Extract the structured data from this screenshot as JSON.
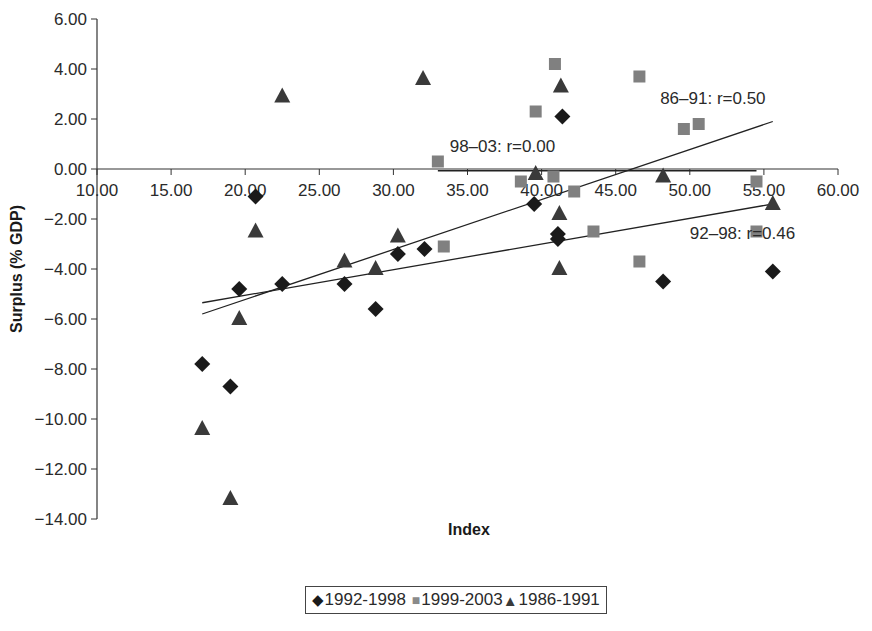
{
  "chart_data": {
    "type": "scatter",
    "title": "",
    "xlabel": "Index",
    "ylabel": "Surplus (% GDP)",
    "xlim": [
      10,
      60
    ],
    "ylim": [
      -14,
      6
    ],
    "x_ticks": [
      "10.00",
      "15.00",
      "20.00",
      "25.00",
      "30.00",
      "35.00",
      "40.00",
      "45.00",
      "50.00",
      "55.00",
      "60.00"
    ],
    "y_ticks": [
      "6.00",
      "4.00",
      "2.00",
      "0.00",
      "-2.00",
      "-4.00",
      "-6.00",
      "-8.00",
      "-10.00",
      "-12.00",
      "-14.00"
    ],
    "grid": false,
    "legend_position": "bottom",
    "series": [
      {
        "name": "1992-1998",
        "marker": "diamond",
        "color": "#1a1a1a",
        "points": [
          [
            17.1,
            -7.8
          ],
          [
            19.0,
            -8.7
          ],
          [
            19.6,
            -4.8
          ],
          [
            20.7,
            -1.1
          ],
          [
            22.5,
            -4.6
          ],
          [
            26.7,
            -4.6
          ],
          [
            28.8,
            -5.6
          ],
          [
            30.3,
            -3.4
          ],
          [
            32.1,
            -3.2
          ],
          [
            39.5,
            -1.4
          ],
          [
            41.1,
            -2.6
          ],
          [
            41.1,
            -2.8
          ],
          [
            41.4,
            2.1
          ],
          [
            48.2,
            -4.5
          ],
          [
            55.6,
            -4.1
          ]
        ]
      },
      {
        "name": "1999-2003",
        "marker": "square",
        "color": "#808080",
        "points": [
          [
            33.0,
            0.3
          ],
          [
            33.4,
            -3.1
          ],
          [
            38.6,
            -0.5
          ],
          [
            39.6,
            2.3
          ],
          [
            40.8,
            -0.3
          ],
          [
            40.9,
            4.2
          ],
          [
            42.2,
            -0.9
          ],
          [
            43.5,
            -2.5
          ],
          [
            46.6,
            3.7
          ],
          [
            46.6,
            -3.7
          ],
          [
            49.6,
            1.6
          ],
          [
            50.6,
            1.8
          ],
          [
            54.5,
            -0.5
          ],
          [
            54.5,
            -2.5
          ]
        ]
      },
      {
        "name": "1986-1991",
        "marker": "triangle",
        "color": "#3a3a3a",
        "points": [
          [
            17.1,
            -10.4
          ],
          [
            19.0,
            -13.2
          ],
          [
            19.6,
            -6.0
          ],
          [
            20.7,
            -2.5
          ],
          [
            22.5,
            2.9
          ],
          [
            26.7,
            -3.7
          ],
          [
            28.8,
            -4.0
          ],
          [
            30.3,
            -2.7
          ],
          [
            32.0,
            3.6
          ],
          [
            39.6,
            -0.2
          ],
          [
            41.2,
            -1.8
          ],
          [
            41.3,
            3.3
          ],
          [
            41.2,
            -4.0
          ],
          [
            48.2,
            -0.3
          ],
          [
            55.6,
            -1.4
          ]
        ]
      }
    ],
    "trendlines": [
      {
        "label": "86–91: r=0.50",
        "from": [
          17.1,
          -5.8
        ],
        "to": [
          55.6,
          1.9
        ],
        "label_pos": [
          48.0,
          2.6
        ]
      },
      {
        "label": "92–98: r=0.46",
        "from": [
          17.1,
          -5.35
        ],
        "to": [
          55.6,
          -1.4
        ],
        "label_pos": [
          50.0,
          -2.8
        ]
      },
      {
        "label": "98–03: r=0.00",
        "from": [
          33.0,
          -0.07
        ],
        "to": [
          54.5,
          -0.07
        ],
        "label_pos": [
          33.8,
          0.7
        ]
      }
    ]
  },
  "legend": {
    "items": [
      {
        "label": "1992-1998",
        "symbol": "◆"
      },
      {
        "label": "1999-2003",
        "symbol": "■"
      },
      {
        "label": "1986-1991",
        "symbol": "▲"
      }
    ]
  }
}
